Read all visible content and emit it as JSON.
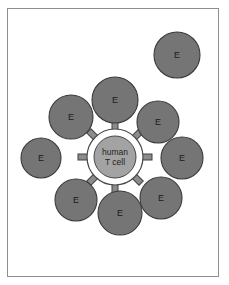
{
  "figure": {
    "background_color": "#ffffff",
    "frame_color": "#8e8e8e"
  },
  "colors": {
    "e_cell_fill": "#757575",
    "e_cell_stroke": "#3a3a3a",
    "center_fill": "#a3a3a3",
    "center_stroke": "#474747",
    "center_ring_fill": "#ffffff",
    "center_ring_stroke": "#4a4a4a",
    "receptor_fill": "#8c8c8c",
    "receptor_stroke": "#3f3f3f",
    "label_color": "#1b1b1b"
  },
  "center_cell": {
    "name": "human-t-cell",
    "line1": "human",
    "line2": "T cell",
    "cx": 115,
    "cy": 157,
    "inner_radius": 21,
    "ring_radius": 28
  },
  "receptors": {
    "count": 8,
    "angles_deg": [
      0,
      45,
      90,
      135,
      180,
      225,
      270,
      315
    ],
    "length": 10,
    "width": 6,
    "inner_offset": 27
  },
  "e_cells": [
    {
      "label": "E",
      "cx": 115,
      "cy": 100,
      "r": 23,
      "position": "north"
    },
    {
      "label": "E",
      "cx": 158,
      "cy": 122,
      "r": 21,
      "position": "north-east"
    },
    {
      "label": "E",
      "cx": 182,
      "cy": 158,
      "r": 21,
      "position": "east"
    },
    {
      "label": "E",
      "cx": 161,
      "cy": 198,
      "r": 21,
      "position": "south-east"
    },
    {
      "label": "E",
      "cx": 120,
      "cy": 213,
      "r": 22,
      "position": "south"
    },
    {
      "label": "E",
      "cx": 76,
      "cy": 200,
      "r": 21,
      "position": "south-west"
    },
    {
      "label": "E",
      "cx": 41,
      "cy": 158,
      "r": 20,
      "position": "west"
    },
    {
      "label": "E",
      "cx": 71,
      "cy": 117,
      "r": 22,
      "position": "north-west"
    },
    {
      "label": "E",
      "cx": 177,
      "cy": 55,
      "r": 23,
      "position": "outer-top-right"
    }
  ]
}
